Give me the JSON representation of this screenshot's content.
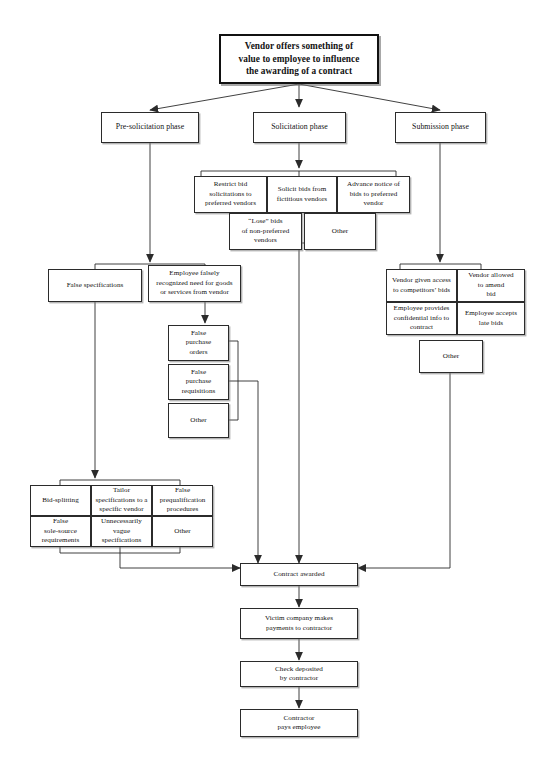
{
  "diagram": {
    "type": "flowchart",
    "background_color": "#ffffff",
    "line_color": "#2b2b2b",
    "text_color": "#121212"
  },
  "root": {
    "label": "Vendor offers something of value to employee to influence the awarding of a contract",
    "lines": [
      "Vendor offers something of",
      "value to employee to influence",
      "the awarding of a contract"
    ]
  },
  "phases": [
    {
      "id": "pre-solicitation",
      "label": "Pre-solicitation phase"
    },
    {
      "id": "solicitation",
      "label": "Solicitation phase"
    },
    {
      "id": "submission",
      "label": "Submission phase"
    }
  ],
  "solicitation_items": [
    {
      "id": "restrict-bid-solicitations",
      "lines": [
        "Restrict bid",
        "solicitations to",
        "preferred vendors"
      ]
    },
    {
      "id": "solicit-fictitious-bids",
      "lines": [
        "Solicit bids from",
        "fictitious vendors"
      ]
    },
    {
      "id": "advance-notice-of-bids",
      "lines": [
        "Advance notice of",
        "bids to preferred",
        "vendor"
      ]
    },
    {
      "id": "lose-bids-non-preferred",
      "lines": [
        "“Lose” bids",
        "of non-preferred",
        "vendors"
      ]
    },
    {
      "id": "solicitation-other",
      "lines": [
        "Other"
      ]
    }
  ],
  "presolicitation_items": [
    {
      "id": "false-specifications",
      "lines": [
        "False specifications"
      ]
    },
    {
      "id": "employee-falsely-recognized-need",
      "lines": [
        "Employee falsely",
        "recognized need for goods",
        "or services from vendor"
      ]
    }
  ],
  "need_recognition_items": [
    {
      "id": "false-purchase-orders",
      "lines": [
        "False",
        "purchase",
        "orders"
      ]
    },
    {
      "id": "false-purchase-requisitions",
      "lines": [
        "False",
        "purchase",
        "requisitions"
      ]
    },
    {
      "id": "need-recognition-other",
      "lines": [
        "Other"
      ]
    }
  ],
  "false_specification_items": [
    {
      "id": "bid-splitting",
      "lines": [
        "Bid-splitting"
      ]
    },
    {
      "id": "tailor-specifications",
      "lines": [
        "Tailor",
        "specifications to a",
        "specific vendor"
      ]
    },
    {
      "id": "false-prequalification",
      "lines": [
        "False",
        "prequalification",
        "procedures"
      ]
    },
    {
      "id": "false-sole-source",
      "lines": [
        "False",
        "sole-source",
        "requirements"
      ]
    },
    {
      "id": "unnecessarily-vague-specifications",
      "lines": [
        "Unnecessarily",
        "vague",
        "specifications"
      ]
    },
    {
      "id": "false-specifications-other",
      "lines": [
        "Other"
      ]
    }
  ],
  "submission_items": [
    {
      "id": "vendor-given-access",
      "lines": [
        "Vendor given access",
        "to competitors’ bids"
      ]
    },
    {
      "id": "vendor-allowed-amend",
      "lines": [
        "Vendor allowed",
        "to amend",
        "bid"
      ]
    },
    {
      "id": "employee-provides-confidential-info",
      "lines": [
        "Employee provides",
        "confidential info to",
        "contract"
      ]
    },
    {
      "id": "employee-accepts-late-bids",
      "lines": [
        "Employee accepts",
        "late bids"
      ]
    },
    {
      "id": "submission-other",
      "lines": [
        "Other"
      ]
    }
  ],
  "outcome_chain": [
    {
      "id": "contract-awarded",
      "lines": [
        "Contract awarded"
      ]
    },
    {
      "id": "victim-company-payments",
      "lines": [
        "Victim company makes",
        "payments to contractor"
      ]
    },
    {
      "id": "check-deposited",
      "lines": [
        "Check deposited",
        "by contractor"
      ]
    },
    {
      "id": "contractor-pays-employee",
      "lines": [
        "Contractor",
        "pays employee"
      ]
    }
  ]
}
